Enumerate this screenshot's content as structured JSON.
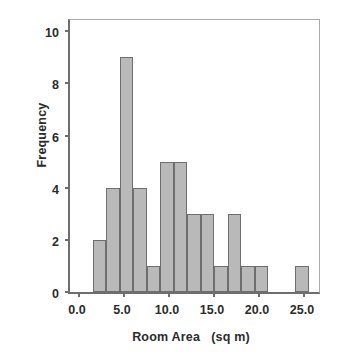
{
  "chart_data": {
    "type": "bar",
    "title": "",
    "xlabel": "Room Area   (sq m)",
    "ylabel": "Frequency",
    "xlim": [
      -1.0,
      27.0
    ],
    "ylim": [
      0,
      10.55
    ],
    "xticks": [
      0.0,
      5.0,
      10.0,
      15.0,
      20.0,
      25.0
    ],
    "xtick_labels": [
      "0.0",
      "5.0",
      "10.0",
      "15.0",
      "20.0",
      "25.0"
    ],
    "yticks": [
      0,
      2,
      4,
      6,
      8,
      10
    ],
    "ytick_labels": [
      "0",
      "2",
      "4",
      "6",
      "8",
      "10"
    ],
    "grid": false,
    "legend": null,
    "bin_width": 1.5,
    "bin_edges": [
      1.5,
      3.0,
      4.5,
      6.0,
      7.5,
      9.0,
      10.5,
      12.0,
      13.5,
      15.0,
      16.5,
      18.0,
      19.5,
      24.0,
      25.5
    ],
    "bars": [
      {
        "x0": 1.5,
        "x1": 3.0,
        "value": 2
      },
      {
        "x0": 3.0,
        "x1": 4.5,
        "value": 4
      },
      {
        "x0": 4.5,
        "x1": 6.0,
        "value": 9
      },
      {
        "x0": 6.0,
        "x1": 7.5,
        "value": 4
      },
      {
        "x0": 7.5,
        "x1": 9.0,
        "value": 1
      },
      {
        "x0": 9.0,
        "x1": 10.5,
        "value": 5
      },
      {
        "x0": 10.5,
        "x1": 12.0,
        "value": 5
      },
      {
        "x0": 12.0,
        "x1": 13.5,
        "value": 3
      },
      {
        "x0": 13.5,
        "x1": 15.0,
        "value": 3
      },
      {
        "x0": 15.0,
        "x1": 16.5,
        "value": 1
      },
      {
        "x0": 16.5,
        "x1": 18.0,
        "value": 3
      },
      {
        "x0": 18.0,
        "x1": 19.5,
        "value": 1
      },
      {
        "x0": 19.5,
        "x1": 21.0,
        "value": 1
      },
      {
        "x0": 24.0,
        "x1": 25.5,
        "value": 1
      }
    ],
    "categories": [
      "1.5-3.0",
      "3.0-4.5",
      "4.5-6.0",
      "6.0-7.5",
      "7.5-9.0",
      "9.0-10.5",
      "10.5-12.0",
      "12.0-13.5",
      "13.5-15.0",
      "15.0-16.5",
      "16.5-18.0",
      "18.0-19.5",
      "19.5-21.0",
      "24.0-25.5"
    ],
    "values": [
      2,
      4,
      9,
      4,
      1,
      5,
      5,
      3,
      3,
      1,
      3,
      1,
      1,
      1
    ],
    "colors": {
      "bar_fill": "#b9b9b9",
      "bar_edge": "#6e6e6e",
      "axis": "#6e6e6e",
      "frame": "#a9a9a9",
      "text": "#2b2b2b",
      "background": "#ffffff"
    }
  }
}
